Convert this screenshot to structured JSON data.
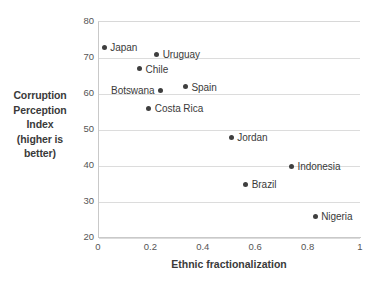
{
  "chart_data": {
    "type": "scatter",
    "title": "",
    "xlabel": "Ethnic fractionalization",
    "ylabel": "Corruption Perception Index (higher is better)",
    "ylabel_lines": [
      "Corruption",
      "Perception",
      "Index",
      "(higher is",
      "better)"
    ],
    "xlim": [
      0,
      1
    ],
    "ylim": [
      20,
      80
    ],
    "xticks": [
      "0",
      "0.2",
      "0.4",
      "0.6",
      "0.8",
      "1"
    ],
    "xtick_values": [
      0,
      0.2,
      0.4,
      0.6,
      0.8,
      1
    ],
    "yticks": [
      "80",
      "70",
      "60",
      "50",
      "40",
      "30",
      "20"
    ],
    "ytick_values": [
      80,
      70,
      60,
      50,
      40,
      30,
      20
    ],
    "grid": "horizontal",
    "legend": "none",
    "marker_color": "#3f3f3f",
    "gridline_color": "#dcdcdc",
    "axis_color": "#c9c9c9",
    "points": [
      {
        "label": "Japan",
        "x": 0.02,
        "y": 73,
        "label_side": "right"
      },
      {
        "label": "Uruguay",
        "x": 0.22,
        "y": 71,
        "label_side": "right"
      },
      {
        "label": "Chile",
        "x": 0.155,
        "y": 67,
        "label_side": "right"
      },
      {
        "label": "Botswana",
        "x": 0.235,
        "y": 61,
        "label_side": "left"
      },
      {
        "label": "Spain",
        "x": 0.33,
        "y": 62,
        "label_side": "right"
      },
      {
        "label": "Costa Rica",
        "x": 0.19,
        "y": 56,
        "label_side": "right"
      },
      {
        "label": "Jordan",
        "x": 0.505,
        "y": 48,
        "label_side": "right"
      },
      {
        "label": "Indonesia",
        "x": 0.735,
        "y": 40,
        "label_side": "right"
      },
      {
        "label": "Brazil",
        "x": 0.56,
        "y": 35,
        "label_side": "right"
      },
      {
        "label": "Nigeria",
        "x": 0.825,
        "y": 26,
        "label_side": "right"
      }
    ]
  }
}
